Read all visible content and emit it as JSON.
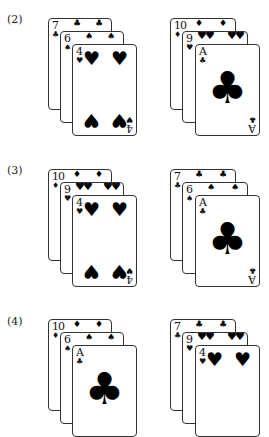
{
  "groups": [
    {
      "label": "(2)",
      "hands": [
        {
          "cards": [
            {
              "rank": "7",
              "suit": "♣",
              "suit_name": "clubs"
            },
            {
              "rank": "6",
              "suit": "♠",
              "suit_name": "spades"
            },
            {
              "rank": "4",
              "suit": "♥",
              "suit_name": "hearts"
            }
          ]
        },
        {
          "cards": [
            {
              "rank": "10",
              "suit": "♦",
              "suit_name": "diamonds"
            },
            {
              "rank": "9",
              "suit": "♥",
              "suit_name": "hearts"
            },
            {
              "rank": "A",
              "suit": "♣",
              "suit_name": "clubs"
            }
          ]
        }
      ]
    },
    {
      "label": "(3)",
      "hands": [
        {
          "cards": [
            {
              "rank": "10",
              "suit": "♦",
              "suit_name": "diamonds"
            },
            {
              "rank": "9",
              "suit": "♥",
              "suit_name": "hearts"
            },
            {
              "rank": "4",
              "suit": "♥",
              "suit_name": "hearts"
            }
          ]
        },
        {
          "cards": [
            {
              "rank": "7",
              "suit": "♣",
              "suit_name": "clubs"
            },
            {
              "rank": "6",
              "suit": "♠",
              "suit_name": "spades"
            },
            {
              "rank": "A",
              "suit": "♣",
              "suit_name": "clubs"
            }
          ]
        }
      ]
    },
    {
      "label": "(4)",
      "hands": [
        {
          "cards": [
            {
              "rank": "10",
              "suit": "♦",
              "suit_name": "diamonds"
            },
            {
              "rank": "6",
              "suit": "♠",
              "suit_name": "spades"
            },
            {
              "rank": "A",
              "suit": "♣",
              "suit_name": "clubs"
            }
          ]
        },
        {
          "cards": [
            {
              "rank": "7",
              "suit": "♣",
              "suit_name": "clubs"
            },
            {
              "rank": "9",
              "suit": "♥",
              "suit_name": "hearts"
            },
            {
              "rank": "4",
              "suit": "♥",
              "suit_name": "hearts"
            }
          ]
        }
      ]
    }
  ]
}
